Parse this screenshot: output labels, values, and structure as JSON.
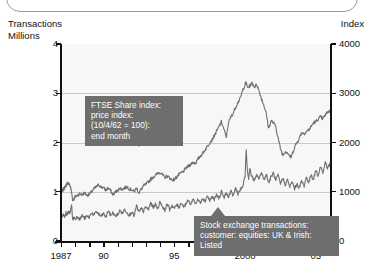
{
  "chart_data": {
    "type": "line",
    "title": "",
    "subtitle": "",
    "xlabel": "",
    "ylabel": "Transactions\nMillions",
    "y2label": "Index",
    "xlim": [
      1987,
      2006
    ],
    "ylim": [
      0,
      4
    ],
    "y2lim": [
      0,
      4000
    ],
    "grid": true,
    "legend_position": "inline-callouts",
    "x_tick_labels": [
      "1987",
      "90",
      "95",
      "2000",
      "05"
    ],
    "x_tick_values": [
      1987,
      1990,
      1995,
      2000,
      2005
    ],
    "x_minor_ticks": [
      1987,
      1988,
      1989,
      1990,
      1991,
      1992,
      1993,
      1994,
      1995,
      1996,
      1997,
      1998,
      1999,
      2000,
      2001,
      2002,
      2003,
      2004,
      2005,
      2006
    ],
    "y_left_ticks": [
      "0",
      "1",
      "2",
      "3",
      "4"
    ],
    "y_left_values": [
      0,
      1,
      2,
      3,
      4
    ],
    "y_right_ticks": [
      "0",
      "1000",
      "2000",
      "3000",
      "4000"
    ],
    "y_right_values": [
      0,
      1000,
      2000,
      3000,
      4000
    ],
    "series": [
      {
        "name": "FTSE Share index: price index: (10/4/62 = 100): end month",
        "axis": "right",
        "units": "Index",
        "color": "#707070",
        "x": [
          1987.0,
          1987.08,
          1987.17,
          1987.25,
          1987.33,
          1987.42,
          1987.5,
          1987.58,
          1987.67,
          1987.75,
          1987.83,
          1987.92,
          1988.0,
          1988.17,
          1988.33,
          1988.5,
          1988.67,
          1988.83,
          1989.0,
          1989.17,
          1989.33,
          1989.5,
          1989.67,
          1989.83,
          1990.0,
          1990.17,
          1990.33,
          1990.5,
          1990.67,
          1990.83,
          1991.0,
          1991.17,
          1991.33,
          1991.5,
          1991.67,
          1991.83,
          1992.0,
          1992.17,
          1992.33,
          1992.5,
          1992.67,
          1992.83,
          1993.0,
          1993.17,
          1993.33,
          1993.5,
          1993.67,
          1993.83,
          1994.0,
          1994.17,
          1994.33,
          1994.5,
          1994.67,
          1994.83,
          1995.0,
          1995.17,
          1995.33,
          1995.5,
          1995.67,
          1995.83,
          1996.0,
          1996.17,
          1996.33,
          1996.5,
          1996.67,
          1996.83,
          1997.0,
          1997.17,
          1997.33,
          1997.5,
          1997.67,
          1997.83,
          1998.0,
          1998.17,
          1998.33,
          1998.5,
          1998.67,
          1998.83,
          1999.0,
          1999.17,
          1999.33,
          1999.5,
          1999.67,
          1999.83,
          2000.0,
          2000.08,
          2000.17,
          2000.33,
          2000.5,
          2000.67,
          2000.83,
          2001.0,
          2001.17,
          2001.33,
          2001.5,
          2001.67,
          2001.83,
          2002.0,
          2002.17,
          2002.33,
          2002.5,
          2002.67,
          2002.83,
          2003.0,
          2003.17,
          2003.25,
          2003.42,
          2003.58,
          2003.75,
          2003.92,
          2004.0,
          2004.17,
          2004.33,
          2004.5,
          2004.67,
          2004.83,
          2005.0,
          2005.17,
          2005.33,
          2005.5,
          2005.67,
          2005.83,
          2006.0
        ],
        "y": [
          980,
          1010,
          1050,
          1080,
          1120,
          1160,
          1180,
          1150,
          1100,
          980,
          820,
          860,
          900,
          930,
          960,
          940,
          980,
          930,
          950,
          1000,
          1060,
          1100,
          1140,
          1100,
          1080,
          1030,
          1080,
          1020,
          940,
          990,
          1030,
          1070,
          1050,
          1080,
          1100,
          1060,
          1040,
          1000,
          1080,
          980,
          1050,
          1120,
          1150,
          1200,
          1250,
          1300,
          1330,
          1380,
          1400,
          1340,
          1290,
          1320,
          1280,
          1240,
          1250,
          1300,
          1350,
          1380,
          1420,
          1480,
          1520,
          1560,
          1600,
          1580,
          1660,
          1720,
          1780,
          1850,
          1920,
          2000,
          2060,
          2140,
          2230,
          2330,
          2420,
          2280,
          2100,
          2400,
          2520,
          2600,
          2720,
          2820,
          2900,
          3060,
          3180,
          3220,
          3110,
          3150,
          3210,
          3130,
          3180,
          3040,
          2880,
          2760,
          2580,
          2280,
          2440,
          2400,
          2320,
          2100,
          1880,
          1740,
          1820,
          1800,
          1720,
          1700,
          1840,
          1960,
          2040,
          2150,
          2200,
          2180,
          2220,
          2260,
          2320,
          2400,
          2420,
          2480,
          2520,
          2480,
          2560,
          2620,
          2640
        ]
      },
      {
        "name": "Stock exchange transactions: customer: equities: UK & Irish: Listed",
        "axis": "left",
        "units": "Millions",
        "color": "#707070",
        "x": [
          1987.0,
          1987.08,
          1987.17,
          1987.25,
          1987.33,
          1987.42,
          1987.5,
          1987.58,
          1987.67,
          1987.75,
          1987.83,
          1987.92,
          1988.0,
          1988.17,
          1988.33,
          1988.5,
          1988.67,
          1988.83,
          1989.0,
          1989.17,
          1989.33,
          1989.5,
          1989.67,
          1989.83,
          1990.0,
          1990.17,
          1990.33,
          1990.5,
          1990.67,
          1990.83,
          1991.0,
          1991.17,
          1991.33,
          1991.5,
          1991.67,
          1991.83,
          1992.0,
          1992.17,
          1992.33,
          1992.5,
          1992.67,
          1992.83,
          1993.0,
          1993.17,
          1993.33,
          1993.5,
          1993.67,
          1993.83,
          1994.0,
          1994.17,
          1994.33,
          1994.5,
          1994.67,
          1994.83,
          1995.0,
          1995.17,
          1995.33,
          1995.5,
          1995.67,
          1995.83,
          1996.0,
          1996.17,
          1996.33,
          1996.5,
          1996.67,
          1996.83,
          1997.0,
          1997.17,
          1997.33,
          1997.5,
          1997.67,
          1997.83,
          1998.0,
          1998.17,
          1998.33,
          1998.5,
          1998.67,
          1998.83,
          1999.0,
          1999.17,
          1999.33,
          1999.5,
          1999.67,
          1999.83,
          2000.0,
          2000.08,
          2000.17,
          2000.25,
          2000.33,
          2000.5,
          2000.67,
          2000.83,
          2001.0,
          2001.17,
          2001.33,
          2001.5,
          2001.67,
          2001.83,
          2002.0,
          2002.17,
          2002.33,
          2002.5,
          2002.67,
          2002.83,
          2003.0,
          2003.17,
          2003.33,
          2003.5,
          2003.67,
          2003.83,
          2004.0,
          2004.17,
          2004.33,
          2004.5,
          2004.67,
          2004.83,
          2005.0,
          2005.17,
          2005.33,
          2005.5,
          2005.67,
          2005.83,
          2006.0
        ],
        "y": [
          0.52,
          0.5,
          0.55,
          0.48,
          0.58,
          0.52,
          0.6,
          0.55,
          0.62,
          0.72,
          0.42,
          0.48,
          0.45,
          0.5,
          0.44,
          0.52,
          0.46,
          0.5,
          0.48,
          0.58,
          0.52,
          0.6,
          0.54,
          0.5,
          0.56,
          0.48,
          0.62,
          0.52,
          0.58,
          0.5,
          0.54,
          0.62,
          0.56,
          0.64,
          0.58,
          0.52,
          0.6,
          0.5,
          0.72,
          0.58,
          0.66,
          0.6,
          0.7,
          0.62,
          0.78,
          0.68,
          0.74,
          0.66,
          0.8,
          0.7,
          0.62,
          0.76,
          0.64,
          0.72,
          0.66,
          0.74,
          0.68,
          0.78,
          0.7,
          0.76,
          0.82,
          0.74,
          0.86,
          0.76,
          0.84,
          0.78,
          0.88,
          0.8,
          0.92,
          0.82,
          0.9,
          0.84,
          0.94,
          0.86,
          1.02,
          0.88,
          0.96,
          0.9,
          1.0,
          0.92,
          1.08,
          0.96,
          1.04,
          1.1,
          1.3,
          1.85,
          1.42,
          1.28,
          1.46,
          1.3,
          1.22,
          1.34,
          1.26,
          1.4,
          1.24,
          1.36,
          1.18,
          1.3,
          1.38,
          1.22,
          1.34,
          1.16,
          1.28,
          1.14,
          1.24,
          1.1,
          1.2,
          1.06,
          1.16,
          1.08,
          1.22,
          1.12,
          1.3,
          1.18,
          1.36,
          1.24,
          1.44,
          1.32,
          1.52,
          1.38,
          1.6,
          1.46,
          1.58
        ]
      }
    ]
  },
  "axes": {
    "left_title_line1": "Transactions",
    "left_title_line2": "Millions",
    "right_title": "Index"
  },
  "callouts": {
    "ftse": "FTSE Share index:\nprice index:\n(10/4/62 = 100):\nend month",
    "transactions": "Stock exchange transactions:\ncustomer: equities: UK & Irish:\nListed"
  },
  "colors": {
    "series_line": "#707070",
    "callout_background": "#6e6e6e",
    "callout_text": "#ffffff",
    "plot_background": "#f7f7f7",
    "gridline": "#c9c9c9",
    "axis": "#111111"
  }
}
